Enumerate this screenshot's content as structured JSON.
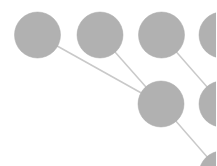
{
  "diagram": {
    "type": "node-link tree",
    "colors": {
      "node": "#b1b1b1",
      "node_edge": "#a9a9a9",
      "link": "#c9c9c9",
      "background": "#ffffff"
    },
    "node_radius": 23,
    "nodes": [
      {
        "id": "n1",
        "x": 37.5,
        "y": 35
      },
      {
        "id": "n2",
        "x": 100,
        "y": 35
      },
      {
        "id": "n3",
        "x": 161.5,
        "y": 35
      },
      {
        "id": "n4",
        "x": 222,
        "y": 35
      },
      {
        "id": "n5",
        "x": 161,
        "y": 104
      },
      {
        "id": "n6",
        "x": 222,
        "y": 104
      },
      {
        "id": "n7",
        "x": 222,
        "y": 174
      }
    ],
    "links": [
      {
        "from": "n1",
        "to": "n5"
      },
      {
        "from": "n2",
        "to": "n5"
      },
      {
        "from": "n3",
        "to": "n6"
      },
      {
        "from": "n5",
        "to": "n7"
      }
    ]
  }
}
